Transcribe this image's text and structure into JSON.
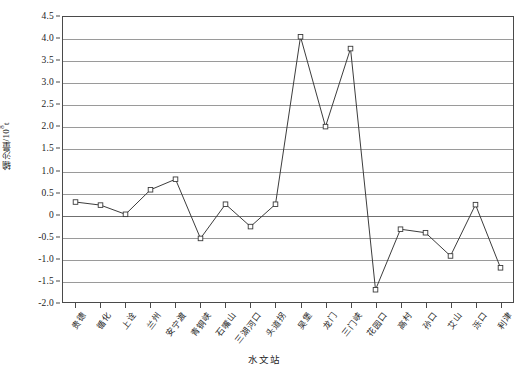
{
  "chart_data": {
    "type": "line",
    "title": "",
    "xlabel": "水文站",
    "ylabel": "输沙量/10⁸t",
    "ylabel_base": "输沙量/10",
    "ylabel_exp": "8",
    "ylabel_unit": "t",
    "ylim": [
      -2.0,
      4.5
    ],
    "ytick_step": 0.5,
    "grid": true,
    "legend": "none",
    "marker": "open-square",
    "line_color": "#3a3a3a",
    "marker_fill": "#ffffff",
    "grid_color": "#9a9a9a",
    "axis_color": "#4a4a4a",
    "yticks": [
      "4.5",
      "4.0",
      "3.5",
      "3.0",
      "2.5",
      "2.0",
      "1.5",
      "1.0",
      "0.5",
      "0",
      "-0.5",
      "-1.0",
      "-1.5",
      "-2.0"
    ],
    "ytick_values": [
      4.5,
      4.0,
      3.5,
      3.0,
      2.5,
      2.0,
      1.5,
      1.0,
      0.5,
      0,
      -0.5,
      -1.0,
      -1.5,
      -2.0
    ],
    "categories": [
      "贵德",
      "循化",
      "上诠",
      "兰州",
      "安宁渡",
      "青铜峡",
      "石嘴山",
      "三湖河口",
      "头道拐",
      "吴堡",
      "龙门",
      "三门峡",
      "花园口",
      "高村",
      "孙口",
      "艾山",
      "泺口",
      "利津"
    ],
    "values": [
      0.28,
      0.21,
      0.0,
      0.56,
      0.8,
      -0.55,
      0.23,
      -0.28,
      0.23,
      4.05,
      2.0,
      3.78,
      -1.72,
      -0.34,
      -0.42,
      -0.95,
      0.22,
      -1.22
    ],
    "series": [
      {
        "name": "输沙量",
        "values": [
          0.28,
          0.21,
          0.0,
          0.56,
          0.8,
          -0.55,
          0.23,
          -0.28,
          0.23,
          4.05,
          2.0,
          3.78,
          -1.72,
          -0.34,
          -0.42,
          -0.95,
          0.22,
          -1.22
        ]
      }
    ]
  }
}
